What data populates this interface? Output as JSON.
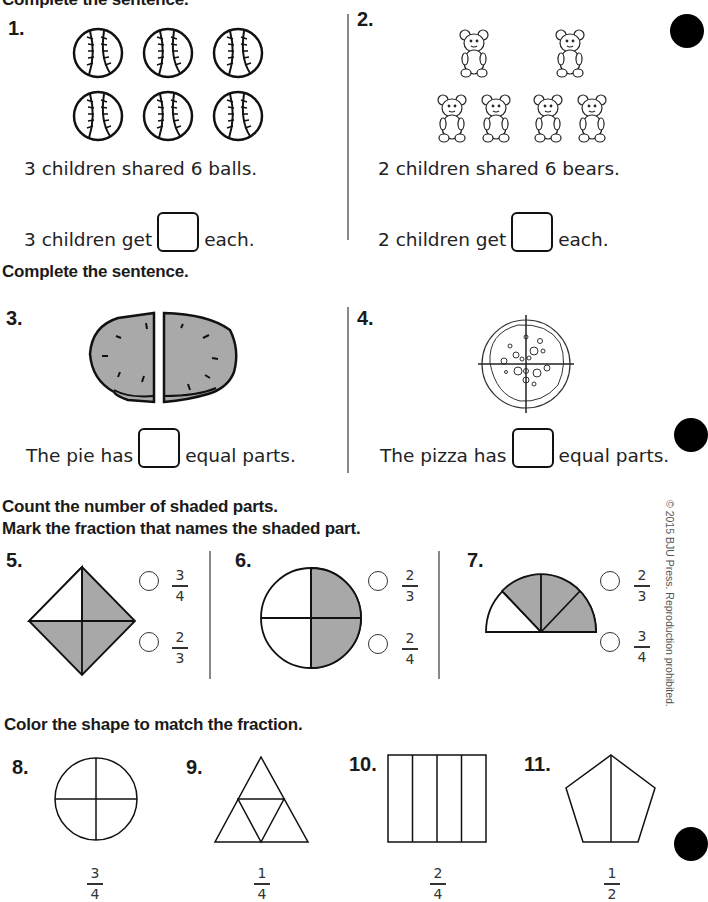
{
  "worksheet": {
    "top_heading_partial": "Complete the sentence.",
    "problems": {
      "p1": {
        "number": "1.",
        "sentence": "3 children shared 6 balls.",
        "answer_prefix": "3 children get",
        "answer_suffix": "each.",
        "icon": "baseball-icon",
        "count": 6
      },
      "p2": {
        "number": "2.",
        "sentence": "2 children shared 6 bears.",
        "answer_prefix": "2 children get",
        "answer_suffix": "each.",
        "icon": "teddy-bear-icon",
        "count": 6
      },
      "p3": {
        "number": "3.",
        "answer_prefix": "The pie has",
        "answer_suffix": "equal parts.",
        "image": "pie-cut-in-halves"
      },
      "p4": {
        "number": "4.",
        "answer_prefix": "The pizza has",
        "answer_suffix": "equal parts.",
        "image": "pizza-cut-in-fourths"
      },
      "p5": {
        "number": "5.",
        "shape": "diamond",
        "parts": 4,
        "shaded": 3,
        "options": [
          {
            "num": "3",
            "den": "4"
          },
          {
            "num": "2",
            "den": "3"
          }
        ]
      },
      "p6": {
        "number": "6.",
        "shape": "circle",
        "parts": 4,
        "shaded": 2,
        "options": [
          {
            "num": "2",
            "den": "3"
          },
          {
            "num": "2",
            "den": "4"
          }
        ]
      },
      "p7": {
        "number": "7.",
        "shape": "half-circle",
        "parts": 4,
        "shaded": 3,
        "options": [
          {
            "num": "2",
            "den": "3"
          },
          {
            "num": "3",
            "den": "4"
          }
        ]
      },
      "p8": {
        "number": "8.",
        "shape": "circle-quarters",
        "fraction": {
          "num": "3",
          "den": "4"
        }
      },
      "p9": {
        "number": "9.",
        "shape": "triangle-quarters",
        "fraction": {
          "num": "1",
          "den": "4"
        }
      },
      "p10": {
        "number": "10.",
        "shape": "rectangle-fourths",
        "fraction": {
          "num": "2",
          "den": "4"
        }
      },
      "p11": {
        "number": "11.",
        "shape": "pentagon-halves",
        "fraction": {
          "num": "1",
          "den": "2"
        }
      }
    },
    "section_headings": {
      "complete_sentence": "Complete the sentence.",
      "count_shaded_line1": "Count the number of shaded parts.",
      "count_shaded_line2": "Mark the fraction that names the shaded part.",
      "color_shape": "Color the shape to match the fraction."
    },
    "copyright": "© 2015 BJU Press. Reproduction prohibited.",
    "colors": {
      "shade": "#a8a8a8",
      "pie_fill": "#a9a9a9",
      "ink": "#111111",
      "divider": "#888888"
    }
  }
}
